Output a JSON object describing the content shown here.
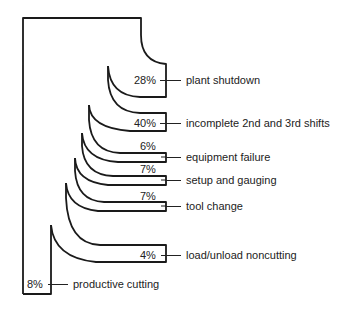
{
  "diagram": {
    "type": "sankey-like breakdown of machine time",
    "stroke_color": "#1a1a1a",
    "segments": [
      {
        "id": "plant-shutdown",
        "percent": "28%",
        "label": "plant shutdown"
      },
      {
        "id": "incomplete-shifts",
        "percent": "40%",
        "label": "incomplete 2nd and 3rd shifts"
      },
      {
        "id": "equipment-failure",
        "percent": "6%",
        "label": "equipment failure"
      },
      {
        "id": "setup-gauging",
        "percent": "7%",
        "label": "setup and gauging"
      },
      {
        "id": "tool-change",
        "percent": "7%",
        "label": "tool change"
      },
      {
        "id": "load-unload",
        "percent": "4%",
        "label": "load/unload noncutting"
      },
      {
        "id": "productive-cutting",
        "percent": "8%",
        "label": "productive cutting"
      }
    ]
  }
}
